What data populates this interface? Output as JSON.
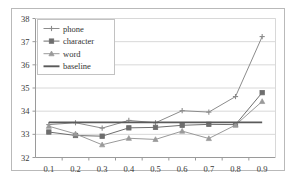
{
  "chart_data": {
    "type": "line",
    "title": "",
    "xlabel": "",
    "ylabel": "",
    "x": [
      0.1,
      0.2,
      0.3,
      0.4,
      0.5,
      0.6,
      0.7,
      0.8,
      0.9
    ],
    "xticklabels": [
      "0.1",
      "0.2",
      "0.3",
      "0.4",
      "0.5",
      "0.6",
      "0.7",
      "0.8",
      "0.9"
    ],
    "yticklabels": [
      "32",
      "33",
      "34",
      "35",
      "36",
      "37",
      "38"
    ],
    "yticks": [
      32,
      33,
      34,
      35,
      36,
      37,
      38
    ],
    "ylim": [
      32,
      38
    ],
    "grid": "horizontal",
    "legend_position": "upper-left",
    "series": [
      {
        "name": "phone",
        "marker": "cross",
        "color": "#8c8c8c",
        "values": [
          33.42,
          33.5,
          33.27,
          33.6,
          33.5,
          34.02,
          33.96,
          34.63,
          37.22
        ]
      },
      {
        "name": "character",
        "marker": "square",
        "color": "#6e6e6e",
        "values": [
          33.1,
          32.95,
          32.92,
          33.28,
          33.3,
          33.39,
          33.43,
          33.42,
          34.8
        ]
      },
      {
        "name": "word",
        "marker": "triangle",
        "color": "#9a9a9a",
        "values": [
          33.35,
          33.02,
          32.55,
          32.83,
          32.78,
          33.14,
          32.82,
          33.4,
          34.42
        ]
      },
      {
        "name": "baseline",
        "marker": "none",
        "color": "#5a5a5a",
        "constant": 33.52,
        "values": [
          33.52,
          33.52,
          33.52,
          33.52,
          33.52,
          33.52,
          33.52,
          33.52,
          33.52
        ]
      }
    ]
  },
  "legend": {
    "items": [
      {
        "label": "phone"
      },
      {
        "label": "character"
      },
      {
        "label": "word"
      },
      {
        "label": "baseline"
      }
    ]
  }
}
